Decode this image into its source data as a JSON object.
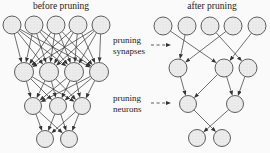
{
  "canvas": {
    "width": 270,
    "height": 153,
    "background": "#fafafa"
  },
  "colors": {
    "node_fill": "#ececec",
    "node_dot": "#d9d9d9",
    "node_stroke": "#4d4d4d",
    "edge": "#333333",
    "text": "#1c1c1c"
  },
  "networks": [
    {
      "id": "before",
      "title": "before pruning",
      "connectivity": "full",
      "layers": [
        {
          "y": 25,
          "r": 9,
          "xs": [
            12,
            34,
            56,
            78,
            101
          ]
        },
        {
          "y": 72,
          "r": 9.5,
          "xs": [
            24,
            49,
            74,
            99
          ]
        },
        {
          "y": 106,
          "r": 8.5,
          "xs": [
            33,
            58,
            82
          ]
        },
        {
          "y": 139,
          "r": 8.5,
          "xs": [
            45,
            69
          ]
        }
      ]
    },
    {
      "id": "after",
      "title": "after pruning",
      "connectivity": "sparse",
      "layers": [
        {
          "y": 26,
          "r": 9,
          "xs": [
            163,
            187,
            210,
            233,
            257
          ]
        },
        {
          "y": 68,
          "r": 9,
          "xs": [
            178,
            224,
            248
          ]
        },
        {
          "y": 104,
          "r": 8.5,
          "xs": [
            188,
            235
          ]
        },
        {
          "y": 138,
          "r": 8.5,
          "xs": [
            197,
            222
          ]
        }
      ],
      "edges": [
        {
          "gap": 0,
          "pairs": [
            [
              0,
              1
            ],
            [
              1,
              0
            ],
            [
              2,
              2
            ],
            [
              3,
              0
            ],
            [
              4,
              1
            ]
          ]
        },
        {
          "gap": 1,
          "pairs": [
            [
              0,
              0
            ],
            [
              1,
              0
            ],
            [
              1,
              1
            ],
            [
              2,
              1
            ]
          ]
        },
        {
          "gap": 2,
          "pairs": [
            [
              0,
              1
            ],
            [
              1,
              0
            ]
          ]
        }
      ]
    }
  ],
  "annotations": [
    {
      "id": "pruning-synapses",
      "lines": [
        "pruning",
        "synapses"
      ],
      "arrow": {
        "x1": 151,
        "y1": 45,
        "x2": 171,
        "y2": 45
      }
    },
    {
      "id": "pruning-neurons",
      "lines": [
        "pruning",
        "neurons"
      ],
      "arrow": {
        "x1": 151,
        "y1": 103,
        "x2": 171,
        "y2": 103
      }
    }
  ]
}
